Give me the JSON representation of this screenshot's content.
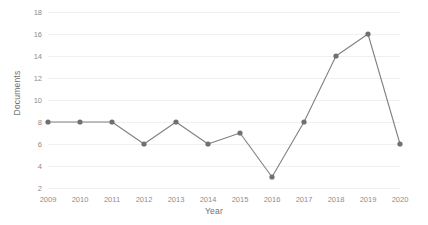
{
  "chart_data": {
    "type": "line",
    "title": "",
    "xlabel": "Year",
    "ylabel": "Documents",
    "categories": [
      "2009",
      "2010",
      "2011",
      "2012",
      "2013",
      "2014",
      "2015",
      "2016",
      "2017",
      "2018",
      "2019",
      "2020"
    ],
    "x": [
      2009,
      2010,
      2011,
      2012,
      2013,
      2014,
      2015,
      2016,
      2017,
      2018,
      2019,
      2020
    ],
    "values": [
      8,
      8,
      8,
      6,
      8,
      6,
      7,
      3,
      8,
      14,
      16,
      6
    ],
    "series": [
      {
        "name": "Documents",
        "values": [
          8,
          8,
          8,
          6,
          8,
          6,
          7,
          3,
          8,
          14,
          16,
          6
        ]
      }
    ],
    "yticks": [
      2,
      4,
      6,
      8,
      10,
      12,
      14,
      16,
      18
    ],
    "ytick_labels": [
      "2",
      "4",
      "6",
      "8",
      "10",
      "12",
      "14",
      "16",
      "18"
    ],
    "xtick_labels": [
      "2009",
      "2010",
      "2011",
      "2012",
      "2013",
      "2014",
      "2015",
      "2016",
      "2017",
      "2018",
      "2019",
      "2020"
    ],
    "ylim": [
      2,
      18
    ],
    "xlim": [
      2009,
      2020
    ],
    "grid": true,
    "grid_axis": "y",
    "legend": false,
    "legend_position": "none",
    "annotations": [],
    "colors": {
      "line": "#808080",
      "marker": "#707070",
      "gridline": "#f0f0f0",
      "tick_label": "#8d8d8d",
      "axis_title": "#6f6f6f",
      "background": "#ffffff"
    },
    "style": {
      "line_width": 1.1,
      "marker": "circle",
      "marker_size": 2.6
    }
  }
}
